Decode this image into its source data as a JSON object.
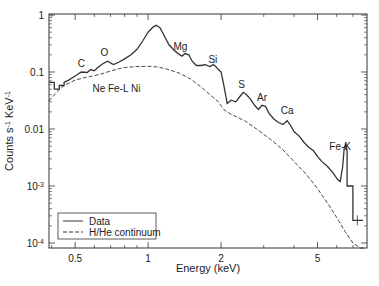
{
  "chart_data": {
    "type": "line",
    "title": "",
    "xlabel": "Energy (keV)",
    "ylabel": "Counts s⁻¹ KeV⁻¹",
    "x_scale": "log",
    "y_scale": "log",
    "xlim": [
      0.39,
      8.0
    ],
    "ylim": [
      0.0001,
      1
    ],
    "grid": false,
    "legend_position": "lower left",
    "x_ticks": [
      {
        "value": 0.5,
        "label": "0.5"
      },
      {
        "value": 1,
        "label": "1"
      },
      {
        "value": 2,
        "label": "2"
      },
      {
        "value": 5,
        "label": "5"
      }
    ],
    "y_ticks": [
      {
        "value": 1,
        "label": "1"
      },
      {
        "value": 0.1,
        "label": "0.1"
      },
      {
        "value": 0.01,
        "label": "0.01"
      },
      {
        "value": 0.001,
        "label": "10",
        "exp": "-3"
      },
      {
        "value": 0.0001,
        "label": "10",
        "exp": "-4"
      }
    ],
    "series": [
      {
        "name": "Data",
        "style": "solid",
        "x": [
          0.39,
          0.41,
          0.41,
          0.43,
          0.43,
          0.45,
          0.45,
          0.47,
          0.5,
          0.53,
          0.56,
          0.58,
          0.6,
          0.62,
          0.65,
          0.68,
          0.72,
          0.76,
          0.8,
          0.85,
          0.9,
          0.95,
          1.0,
          1.05,
          1.08,
          1.12,
          1.17,
          1.22,
          1.28,
          1.33,
          1.38,
          1.42,
          1.47,
          1.52,
          1.58,
          1.65,
          1.72,
          1.8,
          1.86,
          1.9,
          1.95,
          2.0,
          2.05,
          2.12,
          2.2,
          2.3,
          2.4,
          2.47,
          2.55,
          2.65,
          2.75,
          2.85,
          2.95,
          3.05,
          3.15,
          3.3,
          3.45,
          3.6,
          3.75,
          3.85,
          4.0,
          4.2,
          4.4,
          4.6,
          4.8,
          5.0,
          5.2,
          5.5,
          5.8,
          6.05,
          6.2,
          6.35,
          6.45,
          6.55,
          6.62,
          6.62,
          7.0,
          7.0,
          7.3,
          7.3,
          7.7
        ],
        "y": [
          0.066,
          0.066,
          0.05,
          0.05,
          0.058,
          0.058,
          0.066,
          0.072,
          0.085,
          0.1,
          0.098,
          0.11,
          0.105,
          0.12,
          0.14,
          0.155,
          0.135,
          0.15,
          0.17,
          0.2,
          0.25,
          0.35,
          0.5,
          0.62,
          0.66,
          0.6,
          0.42,
          0.3,
          0.24,
          0.21,
          0.19,
          0.21,
          0.2,
          0.155,
          0.13,
          0.13,
          0.135,
          0.125,
          0.135,
          0.125,
          0.11,
          0.1,
          0.06,
          0.028,
          0.032,
          0.03,
          0.038,
          0.044,
          0.04,
          0.033,
          0.026,
          0.022,
          0.026,
          0.025,
          0.019,
          0.015,
          0.013,
          0.012,
          0.014,
          0.012,
          0.009,
          0.0075,
          0.0058,
          0.0048,
          0.0042,
          0.0033,
          0.0027,
          0.0022,
          0.0017,
          0.0013,
          0.0012,
          0.0022,
          0.0048,
          0.0055,
          0.004,
          0.001,
          0.001,
          0.00025,
          0.00025,
          0.00025,
          0.00025
        ]
      },
      {
        "name": "H/He continuum",
        "style": "dashed",
        "x": [
          0.39,
          0.42,
          0.45,
          0.5,
          0.55,
          0.6,
          0.65,
          0.7,
          0.75,
          0.8,
          0.9,
          1.0,
          1.1,
          1.2,
          1.35,
          1.5,
          1.65,
          1.8,
          1.95,
          2.05,
          2.2,
          2.5,
          2.8,
          3.2,
          3.6,
          4.0,
          4.5,
          5.0,
          5.5,
          6.0,
          6.5,
          7.0,
          7.5,
          7.9
        ],
        "y": [
          0.031,
          0.045,
          0.058,
          0.072,
          0.08,
          0.086,
          0.094,
          0.104,
          0.113,
          0.12,
          0.125,
          0.126,
          0.122,
          0.112,
          0.095,
          0.075,
          0.055,
          0.04,
          0.03,
          0.022,
          0.018,
          0.014,
          0.01,
          0.0066,
          0.0043,
          0.0027,
          0.0016,
          0.0009,
          0.0005,
          0.00028,
          0.00016,
          0.0001,
          6e-05,
          4e-05
        ]
      }
    ],
    "annotations": [
      {
        "text": "C",
        "x": 0.53,
        "y": 0.12
      },
      {
        "text": "O",
        "x": 0.66,
        "y": 0.19
      },
      {
        "text": "Ne Fe-L Ni",
        "x": 0.74,
        "y": 0.045
      },
      {
        "text": "Mg",
        "x": 1.36,
        "y": 0.24
      },
      {
        "text": "Si",
        "x": 1.85,
        "y": 0.145
      },
      {
        "text": "S",
        "x": 2.43,
        "y": 0.052
      },
      {
        "text": "Ar",
        "x": 2.95,
        "y": 0.031
      },
      {
        "text": "Ca",
        "x": 3.75,
        "y": 0.018
      },
      {
        "text": "Fe-K",
        "x": 6.2,
        "y": 0.0042
      }
    ],
    "legend": [
      {
        "label": "Data",
        "style": "solid"
      },
      {
        "label": "H/He continuum",
        "style": "dashed"
      }
    ]
  }
}
